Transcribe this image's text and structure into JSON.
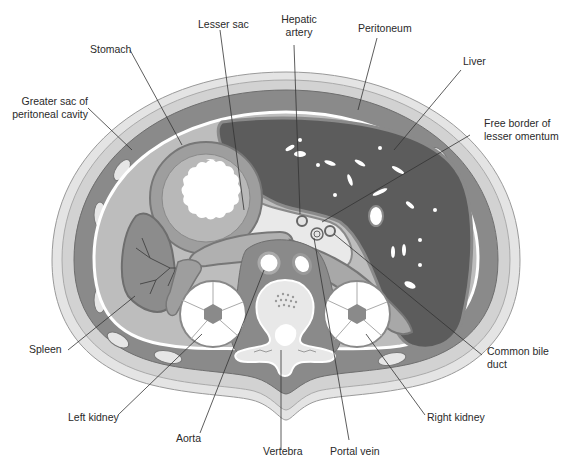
{
  "diagram": {
    "colors": {
      "background": "#ffffff",
      "skin": "#e4e4e4",
      "fat_outer": "#d2d2d2",
      "muscle_wall": "#8a8a8a",
      "peritoneal_cavity": "#bdbdbd",
      "organ_mid": "#9e9e9e",
      "liver": "#5c5c5c",
      "spleen": "#8c8c8c",
      "outline": "#6e6e6e",
      "leader_line": "#333333",
      "label_text": "#2a2a2a"
    },
    "labels": {
      "stomach": "Stomach",
      "lesser_sac": "Lesser sac",
      "hepatic_artery_1": "Hepatic",
      "hepatic_artery_2": "artery",
      "peritoneum": "Peritoneum",
      "liver": "Liver",
      "greater_sac_1": "Greater sac of",
      "greater_sac_2": "peritoneal cavity",
      "free_border_1": "Free border of",
      "free_border_2": "lesser omentum",
      "spleen": "Spleen",
      "common_bile_duct_1": "Common bile",
      "common_bile_duct_2": "duct",
      "left_kidney": "Left kidney",
      "right_kidney": "Right kidney",
      "aorta": "Aorta",
      "vertebra": "Vertebra",
      "portal_vein": "Portal vein"
    }
  }
}
